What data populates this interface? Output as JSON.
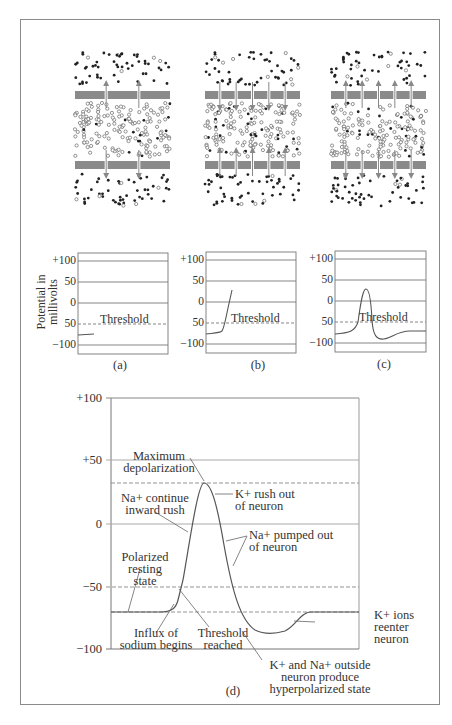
{
  "figure": {
    "membrane_panels": [
      {
        "id": "a",
        "channel_segments": 3,
        "arrows": "outward-sparse",
        "arrow_count_per_membrane": 2
      },
      {
        "id": "b",
        "channel_segments": 6,
        "arrows": "inward",
        "arrow_count_per_membrane": 5
      },
      {
        "id": "c",
        "channel_segments": 6,
        "arrows": "outward",
        "arrow_count_per_membrane": 5
      }
    ],
    "small_charts": {
      "ylabel_line1": "Potential in",
      "ylabel_line2": "millivolts",
      "ticks": [
        "+100",
        "50",
        "0",
        "50",
        "−100"
      ],
      "threshold_label": "Threshold",
      "captions": [
        "(a)",
        "(b)",
        "(c)"
      ]
    },
    "main_chart": {
      "caption": "(d)",
      "ticks": [
        "+100",
        "+50",
        "0",
        "−50",
        "−100"
      ],
      "annotations": {
        "max_depol_1": "Maximum",
        "max_depol_2": "depolarization",
        "k_rush_1": "K+ rush out",
        "k_rush_2": "of neuron",
        "na_continue_1": "Na+ continue",
        "na_continue_2": "inward rush",
        "na_pumped_1": "Na+ pumped out",
        "na_pumped_2": "of neuron",
        "polarized_1": "Polarized",
        "polarized_2": "resting",
        "polarized_3": "state",
        "influx_1": "Influx of",
        "influx_2": "sodium begins",
        "threshold_1": "Threshold",
        "threshold_2": "reached",
        "k_reenter_1": "K+ ions",
        "k_reenter_2": "reenter",
        "k_reenter_3": "neuron",
        "hyper_1": "K+ and Na+ outside",
        "hyper_2": "neuron produce",
        "hyper_3": "hyperpolarized state"
      }
    }
  },
  "chart_data": [
    {
      "type": "line",
      "title": "(a)",
      "ylabel": "Potential in millivolts",
      "ylim": [
        -120,
        120
      ],
      "yticks": [
        100,
        50,
        0,
        -50,
        -100
      ],
      "threshold": -50,
      "series": [
        {
          "name": "membrane potential",
          "x": [
            0,
            0.15
          ],
          "y": [
            -70,
            -70
          ]
        }
      ]
    },
    {
      "type": "line",
      "title": "(b)",
      "ylim": [
        -120,
        120
      ],
      "yticks": [
        100,
        50,
        0,
        -50,
        -100
      ],
      "threshold": -50,
      "series": [
        {
          "name": "membrane potential",
          "x": [
            0,
            0.2,
            0.25,
            0.3
          ],
          "y": [
            -70,
            -67,
            -50,
            30
          ]
        }
      ]
    },
    {
      "type": "line",
      "title": "(c)",
      "ylim": [
        -120,
        120
      ],
      "yticks": [
        100,
        50,
        0,
        -50,
        -100
      ],
      "threshold": -50,
      "series": [
        {
          "name": "membrane potential",
          "x": [
            0,
            0.2,
            0.27,
            0.35,
            0.45,
            0.55,
            0.75,
            1.0
          ],
          "y": [
            -75,
            -65,
            30,
            20,
            -80,
            -85,
            -70,
            -65
          ]
        }
      ]
    },
    {
      "type": "line",
      "title": "(d)",
      "ylim": [
        -100,
        100
      ],
      "yticks": [
        100,
        50,
        0,
        -50,
        -100
      ],
      "reference_lines": [
        30,
        -50,
        -70
      ],
      "series": [
        {
          "name": "action potential",
          "x": [
            0,
            0.2,
            0.28,
            0.33,
            0.45,
            0.52,
            0.6,
            0.7,
            0.85,
            1.0
          ],
          "y": [
            -70,
            -70,
            -60,
            -45,
            30,
            10,
            -60,
            -83,
            -80,
            -70
          ]
        }
      ],
      "annotations": [
        "Maximum depolarization",
        "K+ rush out of neuron",
        "Na+ continue inward rush",
        "Na+ pumped out of neuron",
        "Polarized resting state",
        "Influx of sodium begins",
        "Threshold reached",
        "K+ ions reenter neuron",
        "K+ and Na+ outside neuron produce hyperpolarized state"
      ]
    }
  ]
}
